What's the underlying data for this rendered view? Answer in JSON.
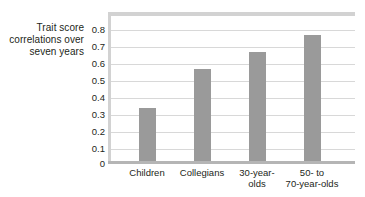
{
  "chart_data": {
    "type": "bar",
    "title": "",
    "subtitle": "",
    "xlabel": "",
    "ylabel": "Trait score correlations over seven years",
    "ylabel_lines": [
      "Trait score",
      "correlations over",
      "seven years"
    ],
    "categories": [
      "Children",
      "Collegians",
      "30-year-olds",
      "50- to 70-year-olds"
    ],
    "category_label_lines": [
      [
        "Children"
      ],
      [
        "Collegians"
      ],
      [
        "30-year-",
        "olds"
      ],
      [
        "50-  to",
        "70-year-olds"
      ]
    ],
    "values": [
      0.31,
      0.54,
      0.64,
      0.74
    ],
    "ylim": [
      0,
      0.85
    ],
    "yticks": [
      0,
      0.1,
      0.2,
      0.3,
      0.4,
      0.5,
      0.6,
      0.7,
      0.8
    ],
    "ytick_labels": [
      "0",
      "0.1",
      "0.2",
      "0.3",
      "0.4",
      "0.5",
      "0.6",
      "0.7",
      "0.8"
    ],
    "grid": true,
    "grid_axis": "y",
    "legend": false,
    "legend_position": "none",
    "bar_color": "#9a9a9a",
    "gridline_color": "#d8d8d8",
    "frame_color": "#d2d2d2",
    "axis_color": "#b5b5b5",
    "background_color": "#ffffff",
    "text_color": "#231f20"
  }
}
